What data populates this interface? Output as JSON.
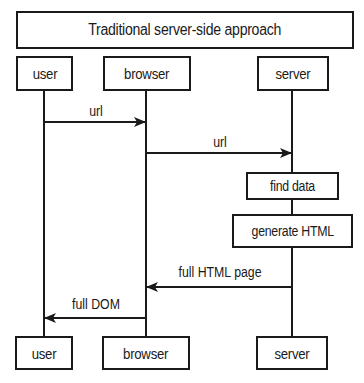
{
  "diagram": {
    "title": "Traditional server-side approach",
    "participants": [
      {
        "id": "user",
        "label": "user"
      },
      {
        "id": "browser",
        "label": "browser"
      },
      {
        "id": "server",
        "label": "server"
      }
    ],
    "steps": [
      {
        "label": "find data"
      },
      {
        "label": "generate HTML"
      }
    ],
    "messages": [
      {
        "from": "user",
        "to": "browser",
        "label": "url"
      },
      {
        "from": "browser",
        "to": "server",
        "label": "url"
      },
      {
        "from": "server",
        "to": "browser",
        "label": "full HTML page"
      },
      {
        "from": "browser",
        "to": "user",
        "label": "full DOM"
      }
    ],
    "colors": {
      "line": "#1a1a1a",
      "background": "#ffffff"
    }
  }
}
